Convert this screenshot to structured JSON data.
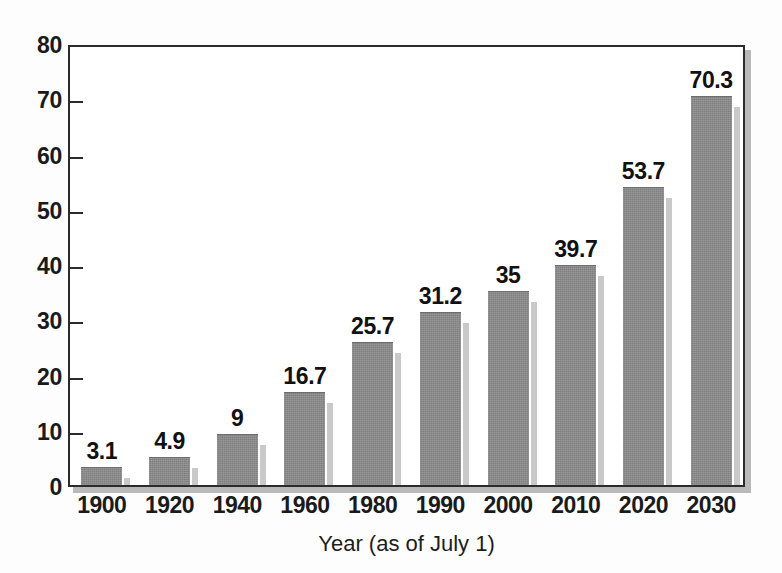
{
  "chart_data": {
    "type": "bar",
    "title": "",
    "subtitle": "",
    "xlabel": "Year (as of July 1)",
    "ylabel": "",
    "categories": [
      "1900",
      "1920",
      "1940",
      "1960",
      "1980",
      "1990",
      "2000",
      "2010",
      "2020",
      "2030"
    ],
    "values": [
      3.1,
      4.9,
      9,
      16.7,
      25.7,
      31.2,
      35,
      39.7,
      53.7,
      70.3
    ],
    "value_labels": [
      "3.1",
      "4.9",
      "9",
      "16.7",
      "25.7",
      "31.2",
      "35",
      "39.7",
      "53.7",
      "70.3"
    ],
    "ylim": [
      0,
      80
    ],
    "ytick_values": [
      0,
      10,
      20,
      30,
      40,
      50,
      60,
      70,
      80
    ],
    "ytick_labels": [
      "0",
      "10",
      "20",
      "30",
      "40",
      "50",
      "60",
      "70",
      "80"
    ],
    "grid": false,
    "legend": null,
    "legend_position": "none",
    "bar_color": "#7f7f7f",
    "bar_shadow_color": "#c9c9c9",
    "axis_color": "#2b2b2b",
    "text_color": "#111111",
    "background_color": "#ffffff"
  }
}
